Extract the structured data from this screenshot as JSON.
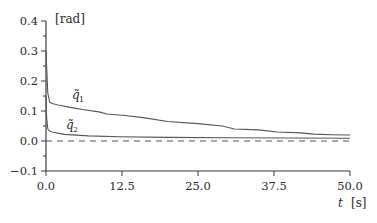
{
  "chart_data": {
    "type": "line",
    "title": "",
    "xlabel": "t",
    "xunit": "[s]",
    "ylabel": "",
    "yunit": "[rad]",
    "xlim": [
      0,
      50
    ],
    "ylim": [
      -0.1,
      0.4
    ],
    "xticks": [
      0,
      12.5,
      25,
      37.5,
      50
    ],
    "xtick_labels": [
      "0.0",
      "12.5",
      "25.0",
      "37.5",
      "50.0"
    ],
    "yticks": [
      -0.1,
      0.0,
      0.1,
      0.2,
      0.3,
      0.4
    ],
    "ytick_labels": [
      "−0.1",
      "0.0",
      "0.1",
      "0.2",
      "0.3",
      "0.4"
    ],
    "grid": false,
    "legend": "inline labels",
    "series": [
      {
        "name": "q̃₁",
        "label_text": "q̃",
        "label_sub": "1",
        "style": "solid",
        "color": "#555555",
        "x": [
          0.0,
          0.1,
          0.3,
          0.6,
          1.0,
          2.0,
          4.0,
          6.0,
          8.7,
          10.0,
          13.0,
          16.0,
          20.0,
          25.0,
          29.0,
          31.0,
          35.0,
          38.0,
          42.0,
          44.0,
          47.0,
          50.0
        ],
        "y": [
          0.3,
          0.25,
          0.16,
          0.13,
          0.125,
          0.12,
          0.112,
          0.105,
          0.097,
          0.09,
          0.085,
          0.078,
          0.065,
          0.058,
          0.05,
          0.04,
          0.037,
          0.03,
          0.027,
          0.023,
          0.021,
          0.02
        ]
      },
      {
        "name": "q̃₂",
        "label_text": "q̃",
        "label_sub": "2",
        "style": "solid",
        "color": "#555555",
        "x": [
          0.0,
          0.1,
          0.3,
          0.6,
          1.0,
          3.0,
          7.0,
          12.0,
          20.0,
          30.0,
          40.0,
          50.0
        ],
        "y": [
          0.15,
          0.08,
          0.04,
          0.033,
          0.03,
          0.022,
          0.017,
          0.014,
          0.012,
          0.011,
          0.01,
          0.009
        ]
      },
      {
        "name": "zero reference",
        "style": "dashed",
        "color": "#555555",
        "x": [
          0.0,
          50.0
        ],
        "y": [
          0.0,
          0.0
        ]
      }
    ]
  },
  "labels": {
    "y_unit": "[rad]",
    "x_var": "t",
    "x_unit": "[s]",
    "q1_base": "q̃",
    "q1_sub": "1",
    "q2_base": "q̃",
    "q2_sub": "2"
  }
}
